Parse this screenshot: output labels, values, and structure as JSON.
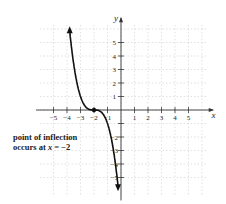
{
  "chart_data": {
    "type": "line",
    "title": "",
    "xlabel": "x",
    "ylabel": "y",
    "xlim": [
      -6,
      6.5
    ],
    "ylim": [
      -6,
      6.5
    ],
    "x_ticks": [
      -5,
      -4,
      -3,
      -2,
      -1,
      1,
      2,
      3,
      4,
      5
    ],
    "y_ticks": [
      -5,
      -4,
      -3,
      -2,
      -1,
      1,
      2,
      3,
      4,
      5
    ],
    "grid": true,
    "function_description": "Decreasing cubic-like curve y = -(x+2)^3 with arrowheads at both ends",
    "series": [
      {
        "name": "curve",
        "x": [
          -3.5,
          -3.3,
          -3.0,
          -2.7,
          -2.4,
          -2.0,
          -1.6,
          -1.3,
          -1.0,
          -0.8,
          -0.6
        ],
        "y": [
          6.0,
          4.4,
          2.0,
          0.6,
          0.1,
          0.0,
          -0.1,
          -0.6,
          -2.0,
          -3.6,
          -6.0
        ]
      }
    ],
    "points": [
      {
        "x": -2,
        "y": 0,
        "label": "point of inflection"
      }
    ],
    "annotations": [
      {
        "text_line1": "point of inflection",
        "text_line2_prefix": "occurs at ",
        "text_line2_var": "x",
        "text_line2_suffix": " = −2"
      }
    ],
    "tick_labels_x": [
      "−5",
      "−4",
      "−3",
      "−2",
      "−1",
      "1",
      "2",
      "3",
      "4",
      "5"
    ],
    "tick_labels_y_pos": [
      "1",
      "2",
      "3",
      "4",
      "5"
    ],
    "tick_labels_y_neg": [
      "−2",
      "−3",
      "−4",
      "−5"
    ]
  }
}
